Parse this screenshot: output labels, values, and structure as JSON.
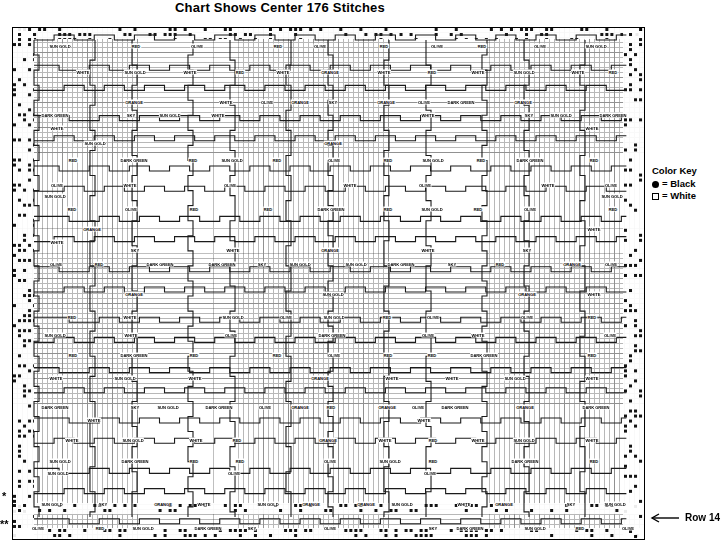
{
  "title": "Chart Shows Center 176 Stitches",
  "color_key": {
    "title": "Color Key",
    "entries": [
      {
        "symbol": "filled-circle",
        "label": "= Black"
      },
      {
        "symbol": "empty-square",
        "label": "= White"
      }
    ]
  },
  "row_annotation": {
    "arrow": "left-arrow-icon",
    "label": "Row 14"
  },
  "markers": {
    "single_asterisk": "*",
    "double_asterisk": "**"
  },
  "chart_data": {
    "type": "heatmap",
    "title": "Chart Shows Center 176 Stitches",
    "xlabel": "",
    "ylabel": "",
    "grid": true,
    "legend_position": "right",
    "stitch_count": 176,
    "colors": [
      "SUN GOLD",
      "RED",
      "OLIVE",
      "WHITE",
      "DARK GREEN",
      "ORANGE",
      "SKY"
    ],
    "cell_size_px": 5,
    "columns": 126,
    "rows": 102,
    "labels": [
      {
        "x": 60,
        "y": 46,
        "text": "SUN GOLD"
      },
      {
        "x": 136,
        "y": 46,
        "text": "RED"
      },
      {
        "x": 197,
        "y": 46,
        "text": "OLIVE"
      },
      {
        "x": 278,
        "y": 46,
        "text": "RED"
      },
      {
        "x": 320,
        "y": 46,
        "text": "OLIVE"
      },
      {
        "x": 384,
        "y": 46,
        "text": "RED"
      },
      {
        "x": 437,
        "y": 46,
        "text": "OLIVE"
      },
      {
        "x": 482,
        "y": 46,
        "text": "RED"
      },
      {
        "x": 540,
        "y": 46,
        "text": "OLIVE"
      },
      {
        "x": 596,
        "y": 46,
        "text": "SUN GOLD"
      },
      {
        "x": 83,
        "y": 72,
        "text": "WHITE"
      },
      {
        "x": 135,
        "y": 72,
        "text": "SUN GOLD"
      },
      {
        "x": 190,
        "y": 72,
        "text": "WHITE"
      },
      {
        "x": 240,
        "y": 72,
        "text": "RED"
      },
      {
        "x": 283,
        "y": 72,
        "text": "WHITE"
      },
      {
        "x": 330,
        "y": 72,
        "text": "ORANGE"
      },
      {
        "x": 384,
        "y": 72,
        "text": "WHITE"
      },
      {
        "x": 432,
        "y": 72,
        "text": "RED"
      },
      {
        "x": 478,
        "y": 72,
        "text": "WHITE"
      },
      {
        "x": 524,
        "y": 72,
        "text": "SUN GOLD"
      },
      {
        "x": 578,
        "y": 72,
        "text": "WHITE"
      },
      {
        "x": 613,
        "y": 72,
        "text": "RED"
      },
      {
        "x": 134,
        "y": 102,
        "text": "ORANGE"
      },
      {
        "x": 226,
        "y": 102,
        "text": "WHITE"
      },
      {
        "x": 267,
        "y": 102,
        "text": "OLIVE"
      },
      {
        "x": 300,
        "y": 102,
        "text": "ORANGE"
      },
      {
        "x": 333,
        "y": 102,
        "text": "SKY"
      },
      {
        "x": 386,
        "y": 102,
        "text": "ORANGE"
      },
      {
        "x": 424,
        "y": 102,
        "text": "OLIVE"
      },
      {
        "x": 461,
        "y": 102,
        "text": "DARK GREEN"
      },
      {
        "x": 523,
        "y": 102,
        "text": "ORANGE"
      },
      {
        "x": 55,
        "y": 115,
        "text": "DARK GREEN"
      },
      {
        "x": 131,
        "y": 115,
        "text": "SKY"
      },
      {
        "x": 170,
        "y": 115,
        "text": "SUN GOLD"
      },
      {
        "x": 218,
        "y": 115,
        "text": "WHITE"
      },
      {
        "x": 428,
        "y": 115,
        "text": "WHITE"
      },
      {
        "x": 529,
        "y": 115,
        "text": "SKY"
      },
      {
        "x": 561,
        "y": 115,
        "text": "SUN GOLD"
      },
      {
        "x": 613,
        "y": 115,
        "text": "DARK GREEN"
      },
      {
        "x": 57,
        "y": 128,
        "text": "WHITE"
      },
      {
        "x": 592,
        "y": 128,
        "text": "WHITE"
      },
      {
        "x": 95,
        "y": 143,
        "text": "SUN GOLD"
      },
      {
        "x": 333,
        "y": 143,
        "text": "ORANGE"
      },
      {
        "x": 73,
        "y": 160,
        "text": "RED"
      },
      {
        "x": 134,
        "y": 160,
        "text": "DARK GREEN"
      },
      {
        "x": 193,
        "y": 160,
        "text": "RED"
      },
      {
        "x": 232,
        "y": 160,
        "text": "SUN GOLD"
      },
      {
        "x": 277,
        "y": 160,
        "text": "RED"
      },
      {
        "x": 334,
        "y": 160,
        "text": "OLIVE"
      },
      {
        "x": 388,
        "y": 160,
        "text": "RED"
      },
      {
        "x": 433,
        "y": 160,
        "text": "SUN GOLD"
      },
      {
        "x": 481,
        "y": 160,
        "text": "RED"
      },
      {
        "x": 530,
        "y": 160,
        "text": "DARK GREEN"
      },
      {
        "x": 594,
        "y": 160,
        "text": "RED"
      },
      {
        "x": 57,
        "y": 185,
        "text": "OLIVE"
      },
      {
        "x": 130,
        "y": 185,
        "text": "WHITE"
      },
      {
        "x": 230,
        "y": 185,
        "text": "OLIVE"
      },
      {
        "x": 350,
        "y": 185,
        "text": "WHITE"
      },
      {
        "x": 425,
        "y": 185,
        "text": "OLIVE"
      },
      {
        "x": 548,
        "y": 185,
        "text": "WHITE"
      },
      {
        "x": 611,
        "y": 185,
        "text": "OLIVE"
      },
      {
        "x": 55,
        "y": 196,
        "text": "SUN GOLD"
      },
      {
        "x": 612,
        "y": 196,
        "text": "SUN GOLD"
      },
      {
        "x": 72,
        "y": 209,
        "text": "RED"
      },
      {
        "x": 131,
        "y": 209,
        "text": "OLIVE"
      },
      {
        "x": 194,
        "y": 209,
        "text": "RED"
      },
      {
        "x": 268,
        "y": 209,
        "text": "RED"
      },
      {
        "x": 331,
        "y": 209,
        "text": "DARK GREEN"
      },
      {
        "x": 388,
        "y": 209,
        "text": "RED"
      },
      {
        "x": 432,
        "y": 209,
        "text": "SUN GOLD"
      },
      {
        "x": 478,
        "y": 209,
        "text": "RED"
      },
      {
        "x": 530,
        "y": 209,
        "text": "OLIVE"
      },
      {
        "x": 613,
        "y": 209,
        "text": "RED"
      },
      {
        "x": 92,
        "y": 229,
        "text": "ORANGE"
      },
      {
        "x": 594,
        "y": 229,
        "text": "WHITE"
      },
      {
        "x": 57,
        "y": 242,
        "text": "WHITE"
      },
      {
        "x": 135,
        "y": 250,
        "text": "SKY"
      },
      {
        "x": 233,
        "y": 250,
        "text": "WHITE"
      },
      {
        "x": 330,
        "y": 250,
        "text": "ORANGE"
      },
      {
        "x": 428,
        "y": 250,
        "text": "WHITE"
      },
      {
        "x": 527,
        "y": 250,
        "text": "SKY"
      },
      {
        "x": 56,
        "y": 264,
        "text": "OLIVE"
      },
      {
        "x": 99,
        "y": 264,
        "text": "RED"
      },
      {
        "x": 160,
        "y": 264,
        "text": "DARK GREEN"
      },
      {
        "x": 222,
        "y": 264,
        "text": "DARK GREEN"
      },
      {
        "x": 262,
        "y": 264,
        "text": "SKY"
      },
      {
        "x": 300,
        "y": 264,
        "text": "SUN GOLD"
      },
      {
        "x": 356,
        "y": 264,
        "text": "SUN GOLD"
      },
      {
        "x": 401,
        "y": 264,
        "text": "DARK GREEN"
      },
      {
        "x": 452,
        "y": 264,
        "text": "SKY"
      },
      {
        "x": 500,
        "y": 264,
        "text": "RED"
      },
      {
        "x": 572,
        "y": 264,
        "text": "ORANGE"
      },
      {
        "x": 611,
        "y": 264,
        "text": "OLIVE"
      },
      {
        "x": 134,
        "y": 294,
        "text": "ORANGE"
      },
      {
        "x": 333,
        "y": 294,
        "text": "SUN GOLD"
      },
      {
        "x": 527,
        "y": 294,
        "text": "ORANGE"
      },
      {
        "x": 594,
        "y": 294,
        "text": "WHITE"
      },
      {
        "x": 72,
        "y": 317,
        "text": "RED"
      },
      {
        "x": 130,
        "y": 317,
        "text": "WHITE"
      },
      {
        "x": 233,
        "y": 317,
        "text": "SUN GOLD"
      },
      {
        "x": 286,
        "y": 317,
        "text": "OLIVE"
      },
      {
        "x": 334,
        "y": 317,
        "text": "SUN GOLD"
      },
      {
        "x": 387,
        "y": 317,
        "text": "RED"
      },
      {
        "x": 433,
        "y": 317,
        "text": "OLIVE"
      },
      {
        "x": 527,
        "y": 317,
        "text": "OLIVE"
      },
      {
        "x": 592,
        "y": 317,
        "text": "RED"
      },
      {
        "x": 55,
        "y": 335,
        "text": "SUN GOLD"
      },
      {
        "x": 131,
        "y": 335,
        "text": "WHITE"
      },
      {
        "x": 231,
        "y": 335,
        "text": "OLIVE"
      },
      {
        "x": 332,
        "y": 335,
        "text": "DARK GREEN"
      },
      {
        "x": 428,
        "y": 335,
        "text": "OLIVE"
      },
      {
        "x": 478,
        "y": 335,
        "text": "WHITE"
      },
      {
        "x": 610,
        "y": 335,
        "text": "OLIVE"
      },
      {
        "x": 73,
        "y": 355,
        "text": "RED"
      },
      {
        "x": 134,
        "y": 355,
        "text": "DARK GREEN"
      },
      {
        "x": 194,
        "y": 355,
        "text": "RED"
      },
      {
        "x": 277,
        "y": 355,
        "text": "RED"
      },
      {
        "x": 334,
        "y": 355,
        "text": "OLIVE"
      },
      {
        "x": 388,
        "y": 355,
        "text": "RED"
      },
      {
        "x": 432,
        "y": 355,
        "text": "RED"
      },
      {
        "x": 484,
        "y": 355,
        "text": "DARK GREEN"
      },
      {
        "x": 592,
        "y": 355,
        "text": "RED"
      },
      {
        "x": 56,
        "y": 378,
        "text": "WHITE"
      },
      {
        "x": 125,
        "y": 378,
        "text": "SUN GOLD"
      },
      {
        "x": 195,
        "y": 378,
        "text": "WHITE"
      },
      {
        "x": 320,
        "y": 378,
        "text": "ORANGE"
      },
      {
        "x": 392,
        "y": 378,
        "text": "WHITE"
      },
      {
        "x": 452,
        "y": 378,
        "text": "WHITE"
      },
      {
        "x": 515,
        "y": 378,
        "text": "SUN GOLD"
      },
      {
        "x": 592,
        "y": 378,
        "text": "WHITE"
      },
      {
        "x": 55,
        "y": 407,
        "text": "DARK GREEN"
      },
      {
        "x": 135,
        "y": 407,
        "text": "SKY"
      },
      {
        "x": 168,
        "y": 407,
        "text": "SUN GOLD"
      },
      {
        "x": 219,
        "y": 407,
        "text": "DARK GREEN"
      },
      {
        "x": 265,
        "y": 407,
        "text": "OLIVE"
      },
      {
        "x": 300,
        "y": 407,
        "text": "ORANGE"
      },
      {
        "x": 331,
        "y": 407,
        "text": "RED"
      },
      {
        "x": 387,
        "y": 407,
        "text": "ORANGE"
      },
      {
        "x": 418,
        "y": 407,
        "text": "OLIVE"
      },
      {
        "x": 455,
        "y": 407,
        "text": "DARK GREEN"
      },
      {
        "x": 525,
        "y": 407,
        "text": "ORANGE"
      },
      {
        "x": 596,
        "y": 407,
        "text": "DARK GREEN"
      },
      {
        "x": 94,
        "y": 420,
        "text": "WHITE"
      },
      {
        "x": 424,
        "y": 420,
        "text": "WHITE"
      },
      {
        "x": 72,
        "y": 440,
        "text": "WHITE"
      },
      {
        "x": 133,
        "y": 440,
        "text": "SUN GOLD"
      },
      {
        "x": 196,
        "y": 440,
        "text": "WHITE"
      },
      {
        "x": 237,
        "y": 440,
        "text": "RED"
      },
      {
        "x": 328,
        "y": 440,
        "text": "ORANGE"
      },
      {
        "x": 385,
        "y": 440,
        "text": "WHITE"
      },
      {
        "x": 433,
        "y": 440,
        "text": "RED"
      },
      {
        "x": 478,
        "y": 440,
        "text": "WHITE"
      },
      {
        "x": 524,
        "y": 440,
        "text": "SUN GOLD"
      },
      {
        "x": 592,
        "y": 440,
        "text": "WHITE"
      },
      {
        "x": 60,
        "y": 461,
        "text": "SUN GOLD"
      },
      {
        "x": 135,
        "y": 461,
        "text": "DARK GREEN"
      },
      {
        "x": 194,
        "y": 461,
        "text": "RED"
      },
      {
        "x": 240,
        "y": 461,
        "text": "RED"
      },
      {
        "x": 330,
        "y": 461,
        "text": "OLIVE"
      },
      {
        "x": 390,
        "y": 461,
        "text": "SUN GOLD"
      },
      {
        "x": 433,
        "y": 461,
        "text": "RED"
      },
      {
        "x": 525,
        "y": 461,
        "text": "DARK GREEN"
      },
      {
        "x": 594,
        "y": 461,
        "text": "RED"
      },
      {
        "x": 58,
        "y": 473,
        "text": "SUN GOLD"
      },
      {
        "x": 234,
        "y": 473,
        "text": "OLIVE"
      },
      {
        "x": 430,
        "y": 473,
        "text": "OLIVE"
      },
      {
        "x": 52,
        "y": 504,
        "text": "SUN GOLD"
      },
      {
        "x": 103,
        "y": 504,
        "text": "SKY"
      },
      {
        "x": 163,
        "y": 504,
        "text": "ORANGE"
      },
      {
        "x": 204,
        "y": 504,
        "text": "WHITE"
      },
      {
        "x": 268,
        "y": 504,
        "text": "SUN GOLD"
      },
      {
        "x": 311,
        "y": 504,
        "text": "ORANGE"
      },
      {
        "x": 366,
        "y": 504,
        "text": "ORANGE"
      },
      {
        "x": 402,
        "y": 504,
        "text": "SUN GOLD"
      },
      {
        "x": 464,
        "y": 504,
        "text": "WHITE"
      },
      {
        "x": 504,
        "y": 504,
        "text": "ORANGE"
      },
      {
        "x": 571,
        "y": 504,
        "text": "SKY"
      },
      {
        "x": 615,
        "y": 504,
        "text": "SUN GOLD"
      },
      {
        "x": 38,
        "y": 528,
        "text": "OLIVE"
      },
      {
        "x": 100,
        "y": 528,
        "text": "RED"
      },
      {
        "x": 143,
        "y": 528,
        "text": "SUN GOLD"
      },
      {
        "x": 208,
        "y": 528,
        "text": "DARK GREEN"
      },
      {
        "x": 252,
        "y": 528,
        "text": "SKY"
      },
      {
        "x": 330,
        "y": 528,
        "text": "OLIVE"
      },
      {
        "x": 433,
        "y": 528,
        "text": "SKY"
      },
      {
        "x": 470,
        "y": 528,
        "text": "DARK GREEN"
      },
      {
        "x": 535,
        "y": 528,
        "text": "SUN GOLD"
      },
      {
        "x": 580,
        "y": 528,
        "text": "RED"
      },
      {
        "x": 628,
        "y": 528,
        "text": "OLIVE"
      }
    ]
  }
}
